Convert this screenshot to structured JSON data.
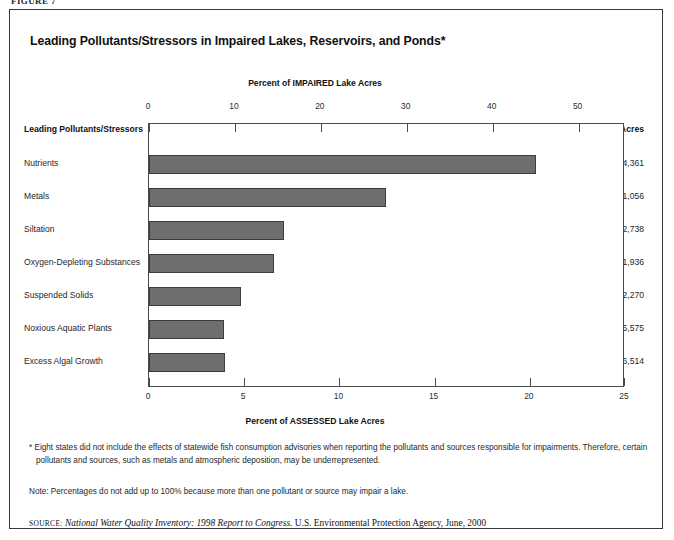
{
  "figure_caption": "FIGURE 7",
  "title": "Leading Pollutants/Stressors in Impaired Lakes, Reservoirs, and Ponds*",
  "axis_top_title": "Percent of IMPAIRED Lake Acres",
  "axis_bottom_title": "Percent of ASSESSED Lake Acres",
  "category_header": "Leading Pollutants/Stressors",
  "acres_header": "Acres",
  "footnote": "* Eight states did not include the effects of statewide fish consumption advisories when reporting the pollutants and sources responsible for impairments. Therefore, certain pollutants and sources, such as metals and atmospheric deposition, may be underrepresented.",
  "note": "Note: Percentages do not add up to 100% because more than one pollutant or source may impair a lake.",
  "source": {
    "label": "source:",
    "title": "National Water Quality Inventory: 1998 Report to Congress.",
    "rest": "U.S. Environmental Protection Agency, June, 2000"
  },
  "colors": {
    "bar_fill": "#6e6e6e",
    "bar_stroke": "#3d3d3d",
    "frame": "#4a4a4a",
    "box": "#3a3a3a",
    "text": "#1f1f1f"
  },
  "chart_data": {
    "type": "bar",
    "orientation": "horizontal",
    "title": "Leading Pollutants/Stressors in Impaired Lakes, Reservoirs, and Ponds*",
    "xlabel": "Percent of IMPAIRED Lake Acres",
    "xlabel_secondary": "Percent of ASSESSED Lake Acres",
    "ylabel": "Leading Pollutants/Stressors",
    "grid": false,
    "legend": "none",
    "xlim_top": [
      0,
      55.4
    ],
    "xlim_bottom": [
      0,
      25
    ],
    "xticks_top": [
      0,
      10,
      20,
      30,
      40,
      50
    ],
    "xticks_top_labels": [
      "0",
      "10",
      "20",
      "30",
      "40",
      "50"
    ],
    "xticks_bottom": [
      0,
      5,
      10,
      15,
      20,
      25
    ],
    "xticks_bottom_labels": [
      "0",
      "5",
      "10",
      "15",
      "20",
      "25"
    ],
    "categories": [
      "Nutrients",
      "Metals",
      "Siltation",
      "Oxygen-Depleting Substances",
      "Suspended Solids",
      "Noxious Aquatic Plants",
      "Excess Algal Growth"
    ],
    "values": [
      45.0,
      27.6,
      15.7,
      14.5,
      10.7,
      8.7,
      8.8
    ],
    "value_unit": "percent of impaired lake acres",
    "acres": [
      "3,454,361",
      "2,111,056",
      "1,172,738",
      "1,101,936",
      "802,270",
      "665,575",
      "626,514"
    ],
    "acres_label": "Acres"
  }
}
